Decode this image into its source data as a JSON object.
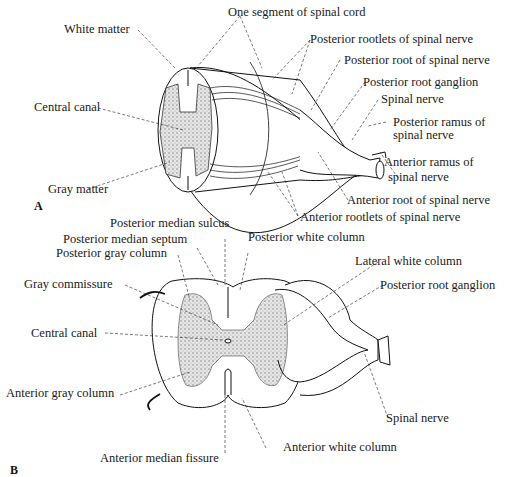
{
  "figure": {
    "panel_a": {
      "letter": "A",
      "labels": {
        "white_matter": "White matter",
        "one_segment": "One segment of spinal cord",
        "posterior_rootlets": "Posterior rootlets of spinal nerve",
        "posterior_root": "Posterior root of spinal nerve",
        "posterior_root_ganglion": "Posterior root ganglion",
        "spinal_nerve": "Spinal nerve",
        "central_canal": "Central canal",
        "posterior_ramus_1": "Posterior ramus of",
        "posterior_ramus_2": "spinal nerve",
        "anterior_ramus_1": "Anterior ramus of",
        "anterior_ramus_2": "spinal nerve",
        "gray_matter": "Gray matter",
        "anterior_root": "Anterior root of spinal nerve",
        "anterior_rootlets": "Anterior rootlets of spinal nerve"
      }
    },
    "panel_b": {
      "letter": "B",
      "labels": {
        "posterior_median_sulcus": "Posterior median sulcus",
        "posterior_median_septum": "Posterior median septum",
        "posterior_white_column": "Posterior white column",
        "posterior_gray_column": "Posterior gray column",
        "lateral_white_column": "Lateral white column",
        "gray_commissure": "Gray commissure",
        "posterior_root_ganglion": "Posterior root ganglion",
        "central_canal": "Central canal",
        "anterior_gray_column": "Anterior gray column",
        "spinal_nerve": "Spinal nerve",
        "anterior_white_column": "Anterior white column",
        "anterior_median_fissure": "Anterior median fissure"
      }
    }
  }
}
